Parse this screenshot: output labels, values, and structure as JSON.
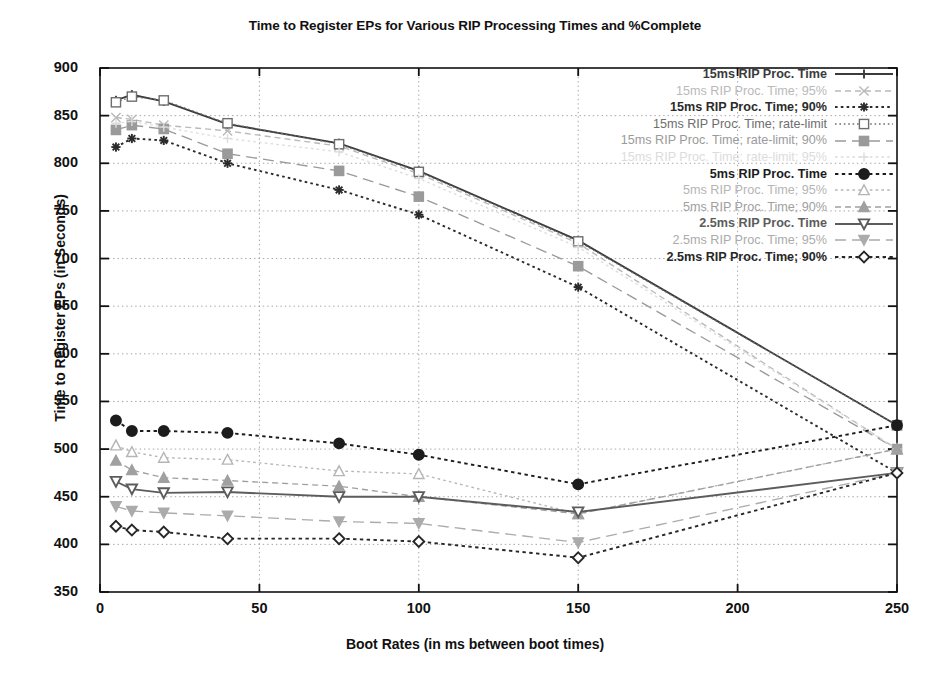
{
  "chart_data": {
    "type": "line",
    "title": "Time to Register EPs for Various RIP Processing Times and %Complete",
    "xlabel": "Boot Rates (in ms between boot times)",
    "ylabel": "Time to Register EPs (in Seconds)",
    "xlim": [
      0,
      250
    ],
    "ylim": [
      350,
      900
    ],
    "xticks": [
      0,
      50,
      100,
      150,
      200,
      250
    ],
    "yticks": [
      350,
      400,
      450,
      500,
      550,
      600,
      650,
      700,
      750,
      800,
      850,
      900
    ],
    "grid": true,
    "legend_position": "top-right inside plot",
    "x": [
      5,
      10,
      20,
      40,
      75,
      100,
      150,
      250
    ],
    "series": [
      {
        "name": "15ms RIP Proc. Time",
        "marker": "plus",
        "line": "solid",
        "color": "#3b3b3b",
        "bold": true,
        "values": [
          866,
          872,
          865,
          841,
          821,
          792,
          719,
          525
        ]
      },
      {
        "name": "15ms RIP Proc. Time; 95%",
        "marker": "x",
        "line": "dashed",
        "color": "#b9b9b9",
        "bold": false,
        "values": [
          848,
          846,
          840,
          834,
          818,
          789,
          716,
          500
        ]
      },
      {
        "name": "15ms RIP Proc. Time; 90%",
        "marker": "asterisk",
        "line": "dotted",
        "color": "#2b2b2b",
        "bold": true,
        "values": [
          817,
          826,
          824,
          800,
          772,
          746,
          670,
          475
        ]
      },
      {
        "name": "15ms RIP Proc. Time; rate-limit",
        "marker": "open-square",
        "line": "dotted-fine",
        "color": "#6e6e6e",
        "bold": false,
        "values": [
          864,
          870,
          866,
          842,
          820,
          791,
          718,
          525
        ]
      },
      {
        "name": "15ms RIP Proc. Time; rate-limit; 90%",
        "marker": "filled-square",
        "line": "dashed-long",
        "color": "#9a9a9a",
        "bold": false,
        "values": [
          835,
          840,
          836,
          810,
          792,
          765,
          692,
          500
        ]
      },
      {
        "name": "15ms RIP Proc. Time; rate-limit; 95%",
        "marker": "plus-light",
        "line": "dotted",
        "color": "#dcdcdc",
        "bold": false,
        "values": [
          842,
          844,
          838,
          826,
          812,
          784,
          712,
          500
        ]
      },
      {
        "name": "5ms RIP Proc. Time",
        "marker": "filled-circle",
        "line": "dotted-thick",
        "color": "#1c1c1c",
        "bold": true,
        "values": [
          530,
          519,
          519,
          517,
          506,
          494,
          463,
          525
        ]
      },
      {
        "name": "5ms RIP Proc. Time; 95%",
        "marker": "open-triangle",
        "line": "dotted",
        "color": "#b5b5b5",
        "bold": false,
        "values": [
          504,
          497,
          491,
          489,
          477,
          474,
          432,
          500
        ]
      },
      {
        "name": "5ms RIP Proc. Time; 90%",
        "marker": "filled-triangle",
        "line": "dashed",
        "color": "#a0a0a0",
        "bold": false,
        "values": [
          488,
          478,
          470,
          467,
          461,
          450,
          432,
          500
        ]
      },
      {
        "name": "2.5ms RIP Proc. Time",
        "marker": "open-inv-triangle",
        "line": "solid",
        "color": "#5c5c5c",
        "bold": true,
        "values": [
          466,
          458,
          454,
          455,
          450,
          450,
          434,
          475
        ]
      },
      {
        "name": "2.5ms RIP Proc. Time; 95%",
        "marker": "filled-inv-triangle",
        "line": "dashed-long",
        "color": "#ababab",
        "bold": false,
        "values": [
          440,
          435,
          433,
          430,
          424,
          422,
          402,
          475
        ]
      },
      {
        "name": "2.5ms RIP Proc. Time; 90%",
        "marker": "open-diamond",
        "line": "dotted-thick",
        "color": "#272727",
        "bold": true,
        "values": [
          419,
          415,
          413,
          406,
          406,
          403,
          386,
          475
        ]
      }
    ]
  }
}
